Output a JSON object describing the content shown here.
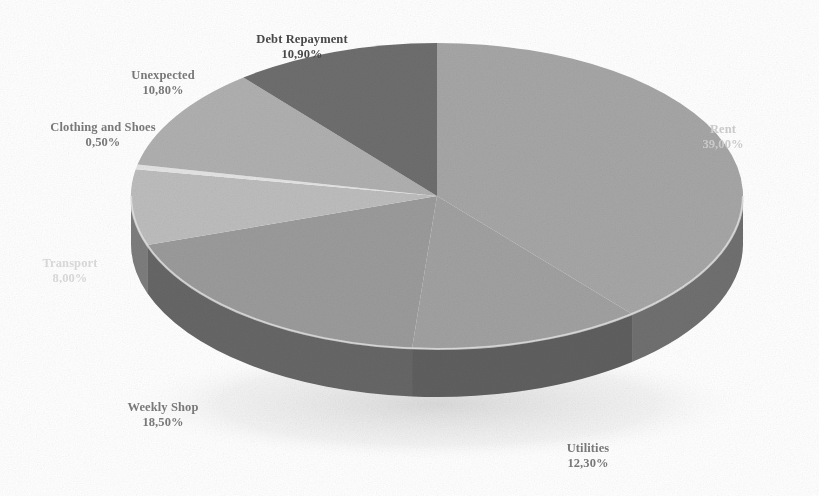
{
  "chart_data": {
    "type": "pie",
    "title": "",
    "subtitle": "",
    "xlabel": "",
    "ylabel": "",
    "style": "3d-pie",
    "legend_position": "none",
    "labels_position": "outside",
    "value_format": "comma-decimal-percent",
    "palette": [
      "#a6a6a6",
      "#8f8f8f",
      "#9b9b9b",
      "#dcdcdc",
      "#ebebeb",
      "#b5b5b5",
      "#6e6e6e"
    ],
    "background": "#ffffff",
    "categories": [
      "Rent",
      "Utilities",
      "Weekly Shop",
      "Transport",
      "Clothing and Shoes",
      "Unexpected",
      "Debt Repayment"
    ],
    "values": [
      39.0,
      12.3,
      18.5,
      8.0,
      0.5,
      10.8,
      10.9
    ],
    "value_labels": [
      "39,00%",
      "12,30%",
      "18,50%",
      "8,00%",
      "0,50%",
      "10,80%",
      "10,90%"
    ],
    "slices": [
      {
        "name": "Rent",
        "value": 39.0,
        "value_label": "39,00%",
        "top_color": "#a6a6a6",
        "side_color": "#6f6f6f"
      },
      {
        "name": "Utilities",
        "value": 12.3,
        "value_label": "12,30%",
        "top_color": "#a1a1a1",
        "side_color": "#5f5f5f"
      },
      {
        "name": "Weekly Shop",
        "value": 18.5,
        "value_label": "18,50%",
        "top_color": "#9b9b9b",
        "side_color": "#666666"
      },
      {
        "name": "Transport",
        "value": 8.0,
        "value_label": "8,00%",
        "top_color": "#bdbdbd",
        "side_color": "#7d7d7d"
      },
      {
        "name": "Clothing and Shoes",
        "value": 0.5,
        "value_label": "0,50%",
        "top_color": "#e4e4e4",
        "side_color": "#9a9a9a"
      },
      {
        "name": "Unexpected",
        "value": 10.8,
        "value_label": "10,80%",
        "top_color": "#b0b0b0",
        "side_color": "#7a7a7a"
      },
      {
        "name": "Debt Repayment",
        "value": 10.9,
        "value_label": "10,90%",
        "top_color": "#6e6e6e",
        "side_color": "#4f4f4f"
      }
    ],
    "total": 100.0
  },
  "labels": {
    "debt_repayment": {
      "name": "Debt Repayment",
      "value": "10,90%"
    },
    "unexpected": {
      "name": "Unexpected",
      "value": "10,80%"
    },
    "clothing": {
      "name": "Clothing and Shoes",
      "value": "0,50%"
    },
    "transport": {
      "name": "Transport",
      "value": "8,00%"
    },
    "weekly_shop": {
      "name": "Weekly Shop",
      "value": "18,50%"
    },
    "utilities": {
      "name": "Utilities",
      "value": "12,30%"
    },
    "rent": {
      "name": "Rent",
      "value": "39,00%"
    }
  }
}
